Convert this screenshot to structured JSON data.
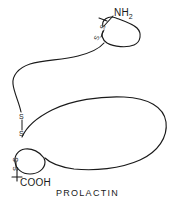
{
  "figure": {
    "title": "PROLACTIN",
    "background_color": "#ffffff",
    "line_color": "#1a1a1a"
  },
  "termini": {
    "n_terminus": {
      "label": "NH",
      "subscript": "2",
      "position": "top-right"
    },
    "c_terminus": {
      "label": "COOH",
      "position": "bottom-left"
    }
  },
  "disulfide_bridges": [
    {
      "id": "bridge-1",
      "location": "n-terminal-loop",
      "upper_label": "S",
      "lower_label": "S"
    },
    {
      "id": "bridge-2",
      "location": "middle-chain",
      "upper_label": "S",
      "lower_label": "S"
    },
    {
      "id": "bridge-3",
      "location": "c-terminal-loop",
      "upper_label": "S",
      "lower_label": "S"
    }
  ]
}
